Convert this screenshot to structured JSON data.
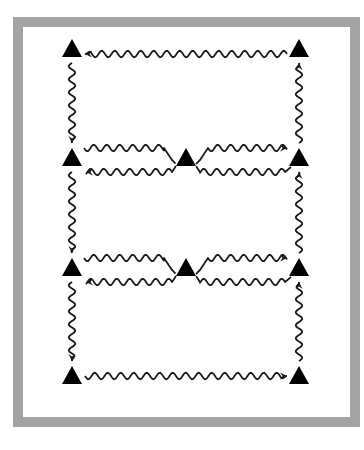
{
  "diagram": {
    "type": "directed-network-of-wavy-arrows",
    "frame_color": "#a3a3a3",
    "stroke_color": "#1a1a1a",
    "node_shape": "triangle",
    "nodes": [
      {
        "id": "TL",
        "x": 72,
        "y": 48
      },
      {
        "id": "TR",
        "x": 299,
        "y": 48
      },
      {
        "id": "L1",
        "x": 72,
        "y": 157
      },
      {
        "id": "C1",
        "x": 186,
        "y": 157
      },
      {
        "id": "R1",
        "x": 299,
        "y": 157
      },
      {
        "id": "L2",
        "x": 72,
        "y": 267
      },
      {
        "id": "C2",
        "x": 186,
        "y": 267
      },
      {
        "id": "R2",
        "x": 299,
        "y": 267
      },
      {
        "id": "BL",
        "x": 72,
        "y": 375
      },
      {
        "id": "BR",
        "x": 299,
        "y": 375
      }
    ],
    "edges": [
      {
        "from": "TR",
        "to": "TL"
      },
      {
        "from": "TL",
        "to": "L1"
      },
      {
        "from": "R1",
        "to": "TR"
      },
      {
        "from": "L1",
        "to": "C1"
      },
      {
        "from": "C1",
        "to": "L1"
      },
      {
        "from": "C1",
        "to": "R1"
      },
      {
        "from": "R1",
        "to": "C1"
      },
      {
        "from": "L1",
        "to": "L2"
      },
      {
        "from": "R2",
        "to": "R1"
      },
      {
        "from": "L2",
        "to": "C2"
      },
      {
        "from": "C2",
        "to": "L2"
      },
      {
        "from": "C2",
        "to": "R2"
      },
      {
        "from": "R2",
        "to": "C2"
      },
      {
        "from": "L2",
        "to": "BL"
      },
      {
        "from": "BR",
        "to": "R2"
      },
      {
        "from": "BL",
        "to": "BR"
      }
    ]
  }
}
